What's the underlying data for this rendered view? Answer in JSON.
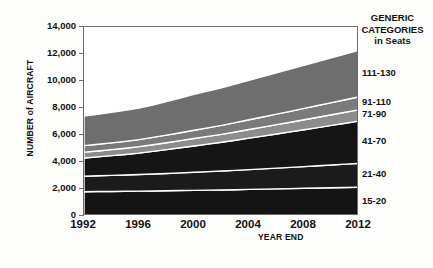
{
  "chart_data": {
    "type": "area",
    "stacked": true,
    "title": "",
    "xlabel": "YEAR END",
    "ylabel": "NUMBER of AIRCRAFT",
    "legend_title_lines": [
      "GENERIC",
      "CATEGORIES",
      "in Seats"
    ],
    "legend_position": "right",
    "grid": false,
    "ylim": [
      0,
      14000
    ],
    "xlim": [
      1992,
      2012
    ],
    "ytick_labels": [
      "14,000",
      "12,000",
      "10,000",
      "8,000",
      "6,000",
      "4,000",
      "2,000",
      "0"
    ],
    "ytick_values": [
      14000,
      12000,
      10000,
      8000,
      6000,
      4000,
      2000,
      0
    ],
    "xtick_labels": [
      "1992",
      "1996",
      "2000",
      "2004",
      "2008",
      "2012"
    ],
    "xtick_values": [
      1992,
      1996,
      2000,
      2004,
      2008,
      2012
    ],
    "x": [
      1992,
      1993,
      1994,
      1995,
      1996,
      1997,
      1998,
      1999,
      2000,
      2001,
      2002,
      2003,
      2004,
      2005,
      2006,
      2007,
      2008,
      2009,
      2010,
      2011,
      2012
    ],
    "series": [
      {
        "name": "15-20",
        "label": "15-20",
        "color": "#141414",
        "values": [
          1800,
          1810,
          1820,
          1830,
          1840,
          1855,
          1870,
          1885,
          1900,
          1915,
          1930,
          1950,
          1970,
          1990,
          2010,
          2030,
          2050,
          2070,
          2090,
          2110,
          2130
        ]
      },
      {
        "name": "21-40",
        "label": "21-40",
        "color": "#1b1b1b",
        "values": [
          1150,
          1170,
          1190,
          1210,
          1230,
          1255,
          1280,
          1310,
          1340,
          1370,
          1400,
          1430,
          1465,
          1500,
          1535,
          1570,
          1610,
          1650,
          1690,
          1730,
          1770
        ]
      },
      {
        "name": "41-70",
        "label": "41-70",
        "color": "#151515",
        "values": [
          1350,
          1400,
          1460,
          1520,
          1590,
          1680,
          1770,
          1860,
          1950,
          2040,
          2130,
          2230,
          2330,
          2430,
          2530,
          2630,
          2730,
          2830,
          2930,
          3030,
          3130
        ]
      },
      {
        "name": "71-90",
        "label": "71-90",
        "color": "#8c8c8c",
        "values": [
          430,
          440,
          450,
          460,
          475,
          490,
          510,
          530,
          550,
          570,
          590,
          615,
          640,
          665,
          690,
          715,
          740,
          765,
          790,
          815,
          840
        ]
      },
      {
        "name": "91-110",
        "label": "91-110",
        "color": "#7a7a7a",
        "values": [
          480,
          490,
          500,
          510,
          525,
          545,
          565,
          585,
          610,
          635,
          660,
          690,
          720,
          750,
          780,
          810,
          840,
          870,
          900,
          930,
          960
        ]
      },
      {
        "name": "111-130",
        "label": "111-130",
        "color": "#6e6e6e",
        "values": [
          2190,
          2230,
          2260,
          2290,
          2330,
          2400,
          2480,
          2570,
          2660,
          2720,
          2780,
          2850,
          2920,
          2990,
          3060,
          3130,
          3200,
          3260,
          3320,
          3380,
          3440
        ]
      }
    ],
    "totals_note": {
      "first_year_total": 7400,
      "last_year_total": 12270
    }
  }
}
